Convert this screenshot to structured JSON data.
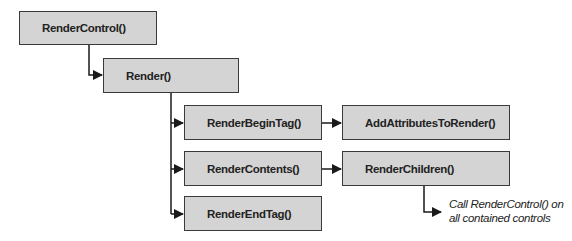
{
  "diagram": {
    "nodes": [
      {
        "id": "render-control",
        "label": "RenderControl()"
      },
      {
        "id": "render",
        "label": "Render()"
      },
      {
        "id": "render-begin-tag",
        "label": "RenderBeginTag()"
      },
      {
        "id": "add-attributes-to-render",
        "label": "AddAttributesToRender()"
      },
      {
        "id": "render-contents",
        "label": "RenderContents()"
      },
      {
        "id": "render-children",
        "label": "RenderChildren()"
      },
      {
        "id": "render-end-tag",
        "label": "RenderEndTag()"
      }
    ],
    "edges": [
      {
        "from": "render-control",
        "to": "render"
      },
      {
        "from": "render",
        "to": "render-begin-tag"
      },
      {
        "from": "render",
        "to": "render-contents"
      },
      {
        "from": "render",
        "to": "render-end-tag"
      },
      {
        "from": "render-begin-tag",
        "to": "add-attributes-to-render"
      },
      {
        "from": "render-contents",
        "to": "render-children"
      },
      {
        "from": "render-children",
        "to": "note"
      }
    ],
    "note": {
      "line1": "Call RenderControl() on",
      "line2": "all contained controls"
    },
    "colors": {
      "box_fill": "#d4d4d4",
      "box_border": "#3a3a3a",
      "line": "#1a1a1a"
    }
  }
}
